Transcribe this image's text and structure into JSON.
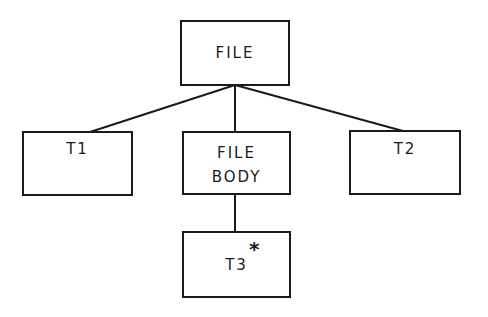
{
  "diagram": {
    "type": "tree",
    "nodes": [
      {
        "id": "file",
        "label_lines": [
          "FILE"
        ]
      },
      {
        "id": "t1",
        "label_lines": [
          "T1"
        ]
      },
      {
        "id": "file_body",
        "label_lines": [
          "FILE",
          "BODY"
        ]
      },
      {
        "id": "t2",
        "label_lines": [
          "T2"
        ]
      },
      {
        "id": "t3",
        "label_lines": [
          "T3"
        ],
        "marker": "*"
      }
    ],
    "edges": [
      {
        "from": "file",
        "to": "t1"
      },
      {
        "from": "file",
        "to": "file_body"
      },
      {
        "from": "file",
        "to": "t2"
      },
      {
        "from": "file_body",
        "to": "t3"
      }
    ]
  }
}
